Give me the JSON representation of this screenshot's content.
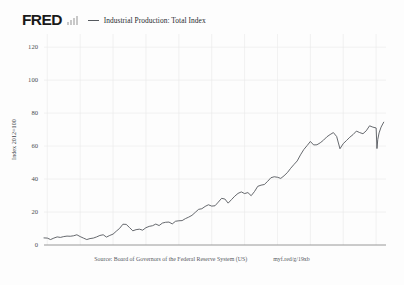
{
  "header": {
    "logo_text": "FRED",
    "logo_bars_icon": "bar-chart-icon",
    "legend": {
      "marker_icon": "line-swatch-icon",
      "label": "Industrial Production: Total Index",
      "color": "#55595e"
    }
  },
  "footer": {
    "source": "Source: Board of Governors of the Federal Reserve System (US)",
    "short_url": "myf.red/g/19xb"
  },
  "chart_data": {
    "type": "line",
    "title": "Industrial Production: Total Index",
    "xlabel": "",
    "ylabel": "Index 2012=100",
    "xlim": [
      1919,
      2023
    ],
    "ylim": [
      0,
      128
    ],
    "yticks": [
      0,
      20,
      40,
      60,
      80,
      100,
      120
    ],
    "ytick_labels": [
      "0",
      "20",
      "40",
      "60",
      "80",
      "100",
      "120"
    ],
    "xticks": [
      1920,
      1930,
      1940,
      1950,
      1960,
      1970,
      1980,
      1990,
      2000,
      2010,
      2020
    ],
    "xtick_labels": [
      "1920",
      "1930",
      "1940",
      "1950",
      "1960",
      "1970",
      "1980",
      "1990",
      "2000",
      "2010",
      "2020"
    ],
    "grid": true,
    "legend_position": "top",
    "line_color": "#4a4e54",
    "series": [
      {
        "name": "Industrial Production: Total Index",
        "units": "Index 2012=100",
        "x": [
          1919,
          1920,
          1921,
          1922,
          1923,
          1924,
          1925,
          1926,
          1927,
          1928,
          1929,
          1930,
          1931,
          1932,
          1933,
          1934,
          1935,
          1936,
          1937,
          1938,
          1939,
          1940,
          1941,
          1942,
          1943,
          1944,
          1945,
          1946,
          1947,
          1948,
          1949,
          1950,
          1951,
          1952,
          1953,
          1954,
          1955,
          1956,
          1957,
          1958,
          1959,
          1960,
          1961,
          1962,
          1963,
          1964,
          1965,
          1966,
          1967,
          1968,
          1969,
          1970,
          1971,
          1972,
          1973,
          1974,
          1975,
          1976,
          1977,
          1978,
          1979,
          1980,
          1981,
          1982,
          1983,
          1984,
          1985,
          1986,
          1987,
          1988,
          1989,
          1990,
          1991,
          1992,
          1993,
          1994,
          1995,
          1996,
          1997,
          1998,
          1999,
          2000,
          2001,
          2002,
          2003,
          2004,
          2005,
          2006,
          2007,
          2008,
          2009,
          2010,
          2011,
          2012,
          2013,
          2014,
          2015,
          2016,
          2017,
          2018,
          2019,
          2020.0,
          2020.25,
          2020.5,
          2020.9,
          2021.5,
          2022.3
        ],
        "values": [
          4.3,
          4.2,
          3.3,
          4.2,
          4.9,
          4.6,
          5.1,
          5.4,
          5.3,
          5.6,
          6.2,
          5.1,
          4.2,
          3.3,
          3.9,
          4.2,
          4.9,
          5.8,
          6.2,
          4.8,
          5.8,
          6.6,
          8.4,
          10.1,
          12.6,
          12.5,
          10.6,
          8.6,
          9.3,
          9.6,
          9.0,
          10.5,
          11.3,
          11.7,
          12.7,
          11.8,
          13.3,
          13.8,
          13.9,
          12.8,
          14.4,
          14.7,
          14.8,
          16.0,
          16.9,
          18.0,
          19.8,
          21.6,
          22.0,
          23.4,
          24.4,
          23.6,
          23.8,
          26.0,
          28.3,
          27.9,
          25.4,
          27.5,
          29.6,
          31.3,
          32.2,
          31.2,
          31.8,
          29.9,
          32.4,
          35.6,
          36.3,
          36.7,
          38.6,
          40.8,
          41.4,
          41.1,
          40.4,
          42.0,
          43.9,
          46.5,
          48.8,
          51.0,
          54.7,
          57.9,
          60.3,
          62.8,
          60.7,
          60.8,
          62.0,
          63.6,
          65.6,
          67.0,
          68.2,
          65.8,
          58.4,
          61.5,
          63.4,
          65.4,
          67.0,
          69.1,
          68.2,
          67.5,
          69.3,
          72.3,
          71.5,
          71.0,
          58.5,
          64.0,
          68.0,
          71.5,
          74.5
        ]
      }
    ],
    "annotations": [
      {
        "label": "Great Depression trough",
        "x": 1932,
        "y": 3.3
      },
      {
        "label": "WWII peak",
        "x": 1943,
        "y": 12.6
      },
      {
        "label": "2008-09 recession trough",
        "x": 2009,
        "y": 58.4
      },
      {
        "label": "COVID-19 collapse",
        "x": 2020.25,
        "y": 58.5
      }
    ]
  }
}
